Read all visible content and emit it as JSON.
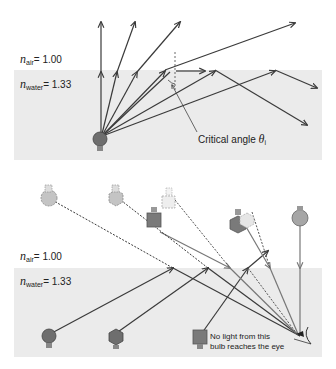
{
  "top_diagram": {
    "n_air_symbol": "n",
    "n_air_sub": "air",
    "n_air_value": "= 1.00",
    "n_water_symbol": "n",
    "n_water_sub": "water",
    "n_water_value": "= 1.33",
    "critical_label": "Critical angle ",
    "critical_symbol": "θ",
    "critical_sub": "i"
  },
  "bottom_diagram": {
    "n_air_symbol": "n",
    "n_air_sub": "air",
    "n_air_value": "= 1.00",
    "n_water_symbol": "n",
    "n_water_sub": "water",
    "n_water_value": "= 1.33",
    "note_line1": "No light from this",
    "note_line2": "bulb reaches the eye"
  },
  "colors": {
    "water": "#ebebeb",
    "ray": "#3a3a3a",
    "bulb_dark": "#6e6e6e",
    "bulb_light": "#bdbdbd"
  }
}
